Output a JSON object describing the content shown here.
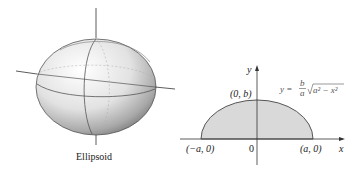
{
  "ellipsoid_figure": {
    "caption": "Ellipsoid"
  },
  "graph": {
    "x_axis_label": "x",
    "y_axis_label": "y",
    "origin_label": "0",
    "point_left": "(−a, 0)",
    "point_right": "(a, 0)",
    "point_top": "(0, b)",
    "equation": {
      "lhs": "y =",
      "frac_num": "b",
      "frac_den": "a",
      "radicand": "a² − x²"
    },
    "region_fill": "#d9d9d9",
    "curve_color": "#555555"
  }
}
